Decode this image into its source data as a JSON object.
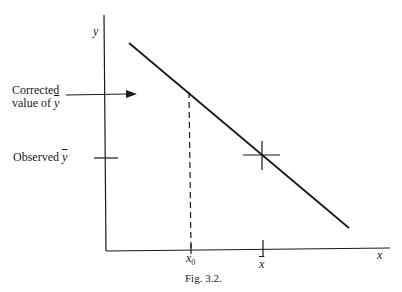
{
  "figure": {
    "caption": "Fig. 3.2.",
    "y_axis_label": "y",
    "x_axis_label": "x",
    "corrected_label_line1": "Corrected",
    "corrected_label_line2": "value of ",
    "corrected_label_symbol": "y",
    "observed_label": "Observed ",
    "observed_symbol": "y",
    "x0_label": "x",
    "x0_subscript": "0",
    "xbar_label": "x",
    "colors": {
      "ink": "#1a1a1a",
      "background": "#ffffff"
    }
  }
}
